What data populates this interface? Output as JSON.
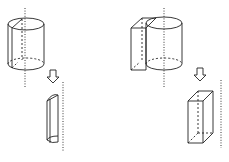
{
  "diagram": {
    "panels": [
      {
        "id": "left",
        "top_solid": "cylinder with dotted central axis and a vertical cutting plane",
        "arrow": "down-arrow",
        "bottom_solid": "half-cylinder segment next to dotted axis"
      },
      {
        "id": "right",
        "top_solid": "cylinder joined with a rectangular prism, dotted central axis",
        "arrow": "down-arrow",
        "bottom_solid": "rectangular prism next to dotted axis"
      }
    ],
    "colors": {
      "line": "#222222",
      "background": "#ffffff"
    }
  }
}
